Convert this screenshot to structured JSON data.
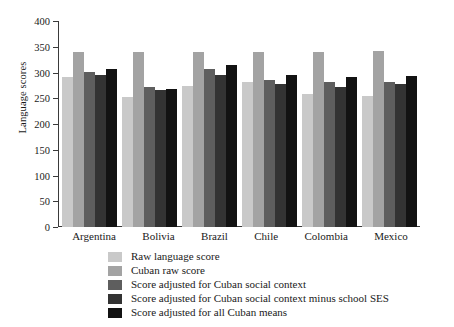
{
  "chart_data": {
    "type": "bar",
    "title": "",
    "xlabel": "",
    "ylabel": "Language scores",
    "ylim": [
      0,
      400
    ],
    "yticks": [
      0,
      50,
      100,
      150,
      200,
      250,
      300,
      350,
      400
    ],
    "ytick_labels": [
      "0",
      "50",
      "100",
      "150",
      "200",
      "250",
      "300",
      "350",
      "400"
    ],
    "grid": false,
    "legend_position": "below-center",
    "categories": [
      "Argentina",
      "Bolivia",
      "Brazil",
      "Chile",
      "Colombia",
      "Mexico"
    ],
    "series": [
      {
        "name": "Raw language score",
        "color": "#c9c9c9",
        "values": [
          291,
          253,
          273,
          281,
          259,
          255
        ]
      },
      {
        "name": "Cuban raw score",
        "color": "#a3a3a3",
        "values": [
          340,
          340,
          340,
          339,
          340,
          341
        ]
      },
      {
        "name": "Score adjusted for Cuban social context",
        "color": "#5e5e5e",
        "values": [
          301,
          272,
          306,
          285,
          282,
          281
        ]
      },
      {
        "name": "Score adjusted for Cuban social context minus school SES",
        "color": "#333333",
        "values": [
          296,
          267,
          295,
          277,
          271,
          278
        ]
      },
      {
        "name": "Score adjusted for all Cuban means",
        "color": "#121212",
        "values": [
          306,
          268,
          315,
          296,
          292,
          293
        ]
      }
    ]
  },
  "axis": {
    "y_title": "Language scores"
  }
}
